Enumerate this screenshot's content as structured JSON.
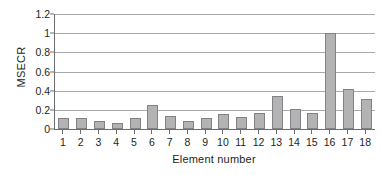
{
  "chart_data": {
    "type": "bar",
    "title": "",
    "xlabel": "Element number",
    "ylabel": "MSECR",
    "categories": [
      "1",
      "2",
      "3",
      "4",
      "5",
      "6",
      "7",
      "8",
      "9",
      "10",
      "11",
      "12",
      "13",
      "14",
      "15",
      "16",
      "17",
      "18"
    ],
    "values": [
      0.115,
      0.115,
      0.085,
      0.065,
      0.11,
      0.25,
      0.14,
      0.085,
      0.115,
      0.155,
      0.13,
      0.17,
      0.34,
      0.21,
      0.17,
      1.0,
      0.415,
      0.31
    ],
    "ylim": [
      0,
      1.2
    ],
    "yticks": [
      "0",
      "0.2",
      "0.4",
      "0.6",
      "0.8",
      "1",
      "1.2"
    ],
    "ytick_values": [
      0,
      0.2,
      0.4,
      0.6,
      0.8,
      1,
      1.2
    ],
    "grid": true,
    "legend": null,
    "bar_color": "#b3b3b3",
    "bar_border_color": "#808285",
    "axis_color": "#6d6e71",
    "gridline_color": "#a7a9ac",
    "background": "#ffffff"
  }
}
